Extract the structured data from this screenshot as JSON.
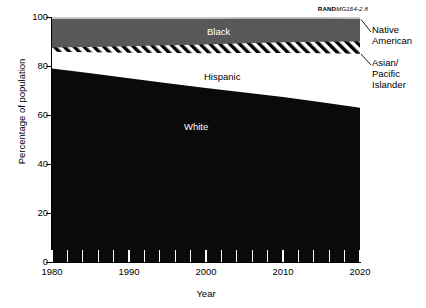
{
  "source_tag": {
    "brand": "RAND",
    "code": "MG164-2.8"
  },
  "axes": {
    "ylabel": "Percentage of population",
    "xlabel": "Year",
    "yticks": [
      "0",
      "20",
      "40",
      "60",
      "80",
      "100"
    ],
    "xticks": [
      "1980",
      "1990",
      "2000",
      "2010",
      "2020"
    ]
  },
  "labels": {
    "black": "Black",
    "hispanic": "Hispanic",
    "white": "White",
    "native_american": "Native\nAmerican",
    "native_american_l1": "Native",
    "native_american_l2": "American",
    "asian_l1": "Asian/",
    "asian_l2": "Pacific",
    "asian_l3": "Islander"
  },
  "chart_data": {
    "type": "area",
    "title": "",
    "subtitle": "",
    "xlabel": "Year",
    "ylabel": "Percentage of population",
    "xlim": [
      1980,
      2020
    ],
    "ylim": [
      0,
      100
    ],
    "grid": false,
    "legend_position": "inline-and-right-annotations",
    "stacked": true,
    "stack_order_bottom_to_top": [
      "White",
      "Hispanic",
      "Asian/Pacific Islander",
      "Black",
      "Native American"
    ],
    "x": [
      1980,
      1985,
      1990,
      1995,
      2000,
      2005,
      2010,
      2015,
      2020
    ],
    "series": [
      {
        "name": "White",
        "fill": "solid-black",
        "color": "#0a0a0a",
        "values": [
          79.0,
          77.0,
          75.0,
          73.0,
          71.0,
          69.2,
          67.3,
          65.2,
          63.0
        ]
      },
      {
        "name": "Hispanic",
        "fill": "solid-white",
        "color": "#ffffff",
        "values": [
          6.8,
          8.6,
          10.4,
          12.3,
          14.2,
          16.1,
          18.0,
          20.0,
          22.0
        ]
      },
      {
        "name": "Asian/Pacific Islander",
        "fill": "diagonal-hatch",
        "color": "#ffffff",
        "values": [
          1.8,
          2.2,
          2.7,
          3.2,
          3.6,
          4.0,
          4.4,
          4.7,
          5.0
        ]
      },
      {
        "name": "Black",
        "fill": "solid-gray",
        "color": "#58585a",
        "values": [
          11.6,
          11.4,
          11.1,
          10.7,
          10.4,
          10.0,
          9.6,
          9.4,
          9.2
        ]
      },
      {
        "name": "Native American",
        "fill": "solid-lightgray",
        "color": "#c8c8c8",
        "values": [
          0.8,
          0.8,
          0.8,
          0.8,
          0.8,
          0.7,
          0.7,
          0.7,
          0.8
        ]
      }
    ],
    "cumulative_tops": {
      "white": [
        79.0,
        77.0,
        75.0,
        73.0,
        71.0,
        69.2,
        67.3,
        65.2,
        63.0
      ],
      "hispanic": [
        85.8,
        85.6,
        85.4,
        85.3,
        85.2,
        85.3,
        85.3,
        85.2,
        85.0
      ],
      "asian": [
        87.6,
        87.8,
        88.1,
        88.5,
        88.8,
        89.3,
        89.7,
        89.9,
        90.0
      ],
      "black": [
        99.2,
        99.2,
        99.2,
        99.2,
        99.2,
        99.3,
        99.3,
        99.3,
        99.2
      ],
      "native": [
        100.0,
        100.0,
        100.0,
        100.0,
        100.0,
        100.0,
        100.0,
        100.0,
        100.0
      ]
    }
  },
  "colors": {
    "white_band": "#0a0a0a",
    "hispanic_band": "#ffffff",
    "asian_band_hatch": "#000000",
    "black_band": "#58585a",
    "native_band": "#c8c8c8",
    "axis": "#000000"
  }
}
